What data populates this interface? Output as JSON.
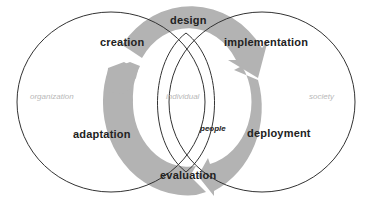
{
  "diagram": {
    "type": "venn-cycle",
    "circles": [
      {
        "id": "organization",
        "label": "organization"
      },
      {
        "id": "individual",
        "label": "individual"
      },
      {
        "id": "society",
        "label": "society"
      }
    ],
    "cycle_phases": [
      {
        "id": "design",
        "label": "design"
      },
      {
        "id": "implementation",
        "label": "implementation"
      },
      {
        "id": "deployment",
        "label": "deployment"
      },
      {
        "id": "evaluation",
        "label": "evaluation"
      },
      {
        "id": "adaptation",
        "label": "adaptation"
      },
      {
        "id": "creation",
        "label": "creation"
      }
    ],
    "center_label": "people",
    "colors": {
      "ring": "#b3b3b3",
      "outline": "#333333",
      "phase_text": "#222222",
      "domain_text": "#b8b8b8"
    }
  }
}
